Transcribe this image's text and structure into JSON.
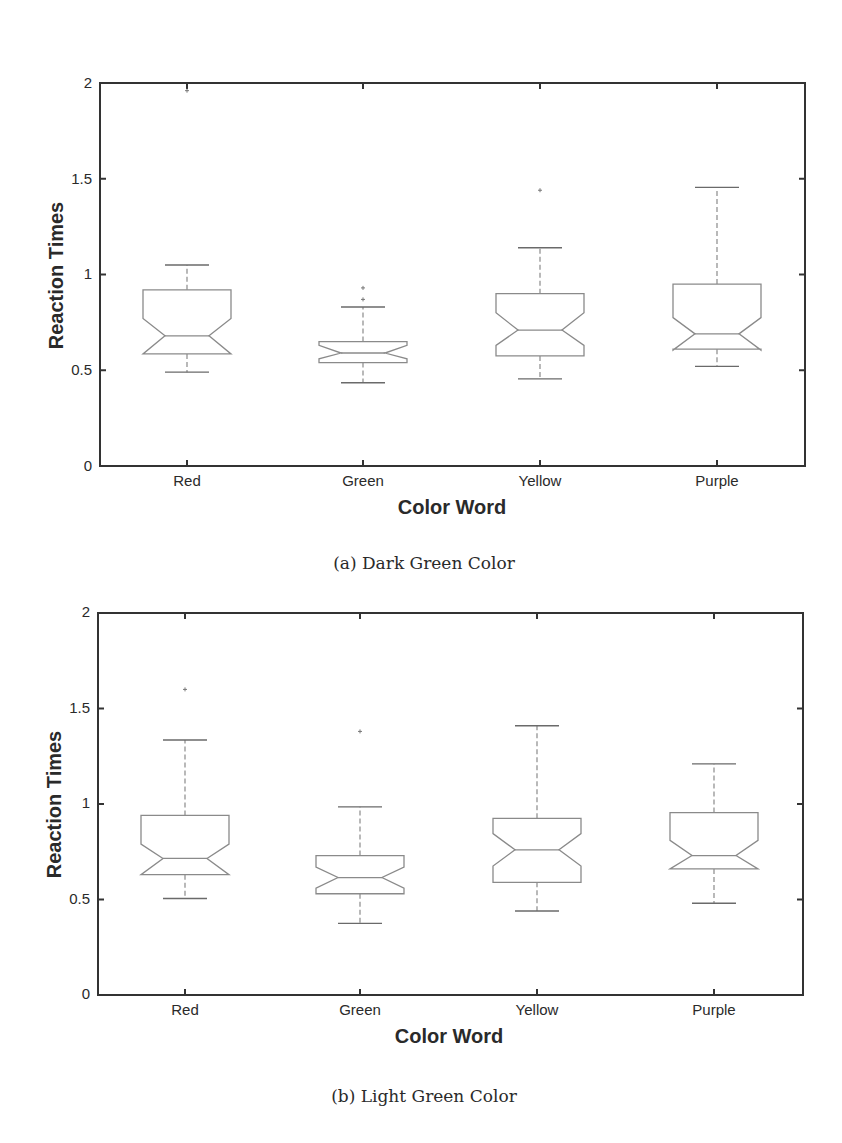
{
  "figures": [
    {
      "id": "a",
      "caption": "(a) Dark Green Color",
      "ylabel": "Reaction Times",
      "xlabel": "Color Word",
      "yticks": [
        "0",
        "0.5",
        "1",
        "1.5",
        "2"
      ],
      "categories": [
        "Red",
        "Green",
        "Yellow",
        "Purple"
      ]
    },
    {
      "id": "b",
      "caption": "(b) Light Green Color",
      "ylabel": "Reaction Times",
      "xlabel": "Color Word",
      "yticks": [
        "0",
        "0.5",
        "1",
        "1.5",
        "2"
      ],
      "categories": [
        "Red",
        "Green",
        "Yellow",
        "Purple"
      ]
    }
  ],
  "chart_data": [
    {
      "type": "boxplot",
      "title": "(a) Dark Green Color",
      "xlabel": "Color Word",
      "ylabel": "Reaction Times",
      "ylim": [
        0,
        2
      ],
      "yticks": [
        0,
        0.5,
        1,
        1.5,
        2
      ],
      "grid": false,
      "notched": true,
      "categories": [
        "Red",
        "Green",
        "Yellow",
        "Purple"
      ],
      "series": [
        {
          "name": "Red",
          "whisker_low": 0.49,
          "q1": 0.585,
          "notch_low": 0.585,
          "median": 0.68,
          "notch_high": 0.77,
          "q3": 0.92,
          "whisker_high": 1.05,
          "outliers": [
            1.96
          ]
        },
        {
          "name": "Green",
          "whisker_low": 0.435,
          "q1": 0.54,
          "notch_low": 0.56,
          "median": 0.59,
          "notch_high": 0.63,
          "q3": 0.65,
          "whisker_high": 0.83,
          "outliers": [
            0.87,
            0.93
          ]
        },
        {
          "name": "Yellow",
          "whisker_low": 0.455,
          "q1": 0.575,
          "notch_low": 0.63,
          "median": 0.71,
          "notch_high": 0.8,
          "q3": 0.9,
          "whisker_high": 1.14,
          "outliers": [
            1.44
          ]
        },
        {
          "name": "Purple",
          "whisker_low": 0.52,
          "q1": 0.61,
          "notch_low": 0.605,
          "median": 0.69,
          "notch_high": 0.775,
          "q3": 0.95,
          "whisker_high": 1.455,
          "outliers": []
        }
      ]
    },
    {
      "type": "boxplot",
      "title": "(b) Light Green Color",
      "xlabel": "Color Word",
      "ylabel": "Reaction Times",
      "ylim": [
        0,
        2
      ],
      "yticks": [
        0,
        0.5,
        1,
        1.5,
        2
      ],
      "grid": false,
      "notched": true,
      "categories": [
        "Red",
        "Green",
        "Yellow",
        "Purple"
      ],
      "series": [
        {
          "name": "Red",
          "whisker_low": 0.505,
          "q1": 0.63,
          "notch_low": 0.63,
          "median": 0.715,
          "notch_high": 0.79,
          "q3": 0.94,
          "whisker_high": 1.335,
          "outliers": [
            1.6
          ]
        },
        {
          "name": "Green",
          "whisker_low": 0.375,
          "q1": 0.53,
          "notch_low": 0.56,
          "median": 0.615,
          "notch_high": 0.67,
          "q3": 0.73,
          "whisker_high": 0.985,
          "outliers": [
            1.38
          ]
        },
        {
          "name": "Yellow",
          "whisker_low": 0.44,
          "q1": 0.59,
          "notch_low": 0.675,
          "median": 0.76,
          "notch_high": 0.845,
          "q3": 0.925,
          "whisker_high": 1.41,
          "outliers": []
        },
        {
          "name": "Purple",
          "whisker_low": 0.48,
          "q1": 0.66,
          "notch_low": 0.66,
          "median": 0.73,
          "notch_high": 0.81,
          "q3": 0.955,
          "whisker_high": 1.21,
          "outliers": []
        }
      ]
    }
  ],
  "style": {
    "axis_color": "#333333",
    "box_color": "#8a8a8a",
    "text_color": "#2a2a2a"
  }
}
